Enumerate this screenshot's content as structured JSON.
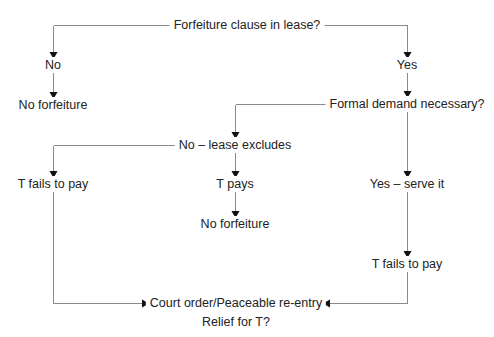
{
  "diagram": {
    "type": "flowchart",
    "colors": {
      "line": "#8a8a8a",
      "arrowhead": "#111111",
      "text": "#222222",
      "background": "#ffffff"
    },
    "nodes": {
      "root": "Forfeiture clause in lease?",
      "no": "No",
      "no_forfeiture_left": "No forfeiture",
      "yes": "Yes",
      "formal_demand": "Formal demand necessary?",
      "no_lease_excludes": "No – lease excludes",
      "t_fails_left": "T fails to pay",
      "t_pays": "T pays",
      "no_forfeiture_mid": "No forfeiture",
      "yes_serve_it": "Yes – serve it",
      "t_fails_right": "T fails to pay",
      "court_order": "Court order/Peaceable re-entry",
      "relief": "Relief for T?"
    },
    "edges": [
      {
        "from": "root",
        "to": "no"
      },
      {
        "from": "no",
        "to": "no_forfeiture_left"
      },
      {
        "from": "root",
        "to": "yes"
      },
      {
        "from": "yes",
        "to": "formal_demand"
      },
      {
        "from": "formal_demand",
        "to": "no_lease_excludes"
      },
      {
        "from": "formal_demand",
        "to": "yes_serve_it"
      },
      {
        "from": "no_lease_excludes",
        "to": "t_fails_left"
      },
      {
        "from": "no_lease_excludes",
        "to": "t_pays"
      },
      {
        "from": "t_pays",
        "to": "no_forfeiture_mid"
      },
      {
        "from": "yes_serve_it",
        "to": "t_fails_right"
      },
      {
        "from": "t_fails_left",
        "to": "court_order"
      },
      {
        "from": "t_fails_right",
        "to": "court_order"
      }
    ]
  }
}
